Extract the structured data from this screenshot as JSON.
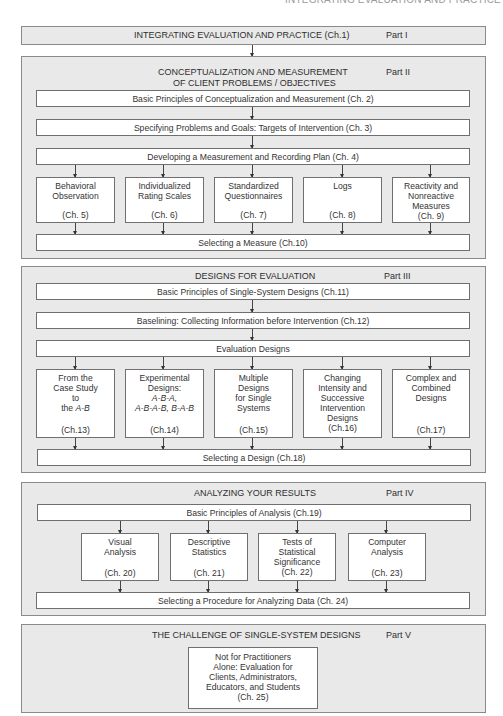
{
  "running_head": "INTEGRATING EVALUATION AND PRACTICE",
  "parts": {
    "p1": {
      "title": "INTEGRATING EVALUATION AND PRACTICE (Ch.1)",
      "label": "Part I"
    },
    "p2": {
      "title_line1": "CONCEPTUALIZATION AND MEASUREMENT",
      "title_line2": "OF CLIENT PROBLEMS / OBJECTIVES",
      "label": "Part II",
      "ch2": "Basic Principles of Conceptualization and Measurement (Ch. 2)",
      "ch3": "Specifying Problems and Goals: Targets of Intervention (Ch. 3)",
      "ch4": "Developing a Measurement and Recording Plan (Ch. 4)",
      "items": [
        {
          "lines": [
            "Behavioral",
            "Observation"
          ],
          "ch": "(Ch. 5)"
        },
        {
          "lines": [
            "Individualized",
            "Rating Scales"
          ],
          "ch": "(Ch. 6)"
        },
        {
          "lines": [
            "Standardized",
            "Questionnaires"
          ],
          "ch": "(Ch. 7)"
        },
        {
          "lines": [
            "Logs"
          ],
          "ch": "(Ch. 8)"
        },
        {
          "lines": [
            "Reactivity and",
            "Nonreactive",
            "Measures"
          ],
          "ch": "(Ch. 9)"
        }
      ],
      "ch10": "Selecting a Measure (Ch.10)"
    },
    "p3": {
      "title": "DESIGNS FOR EVALUATION",
      "label": "Part III",
      "ch11": "Basic Principles of Single-System Designs (Ch.11)",
      "ch12": "Baselining: Collecting Information before Intervention (Ch.12)",
      "eval": "Evaluation Designs",
      "items": [
        {
          "lines": [
            "From the",
            "Case Study",
            "to",
            "the A-B"
          ],
          "ch": "(Ch.13)"
        },
        {
          "lines": [
            "Experimental",
            "Designs:",
            "A-B-A,",
            "A-B-A-B, B-A-B"
          ],
          "ch": "(Ch.14)"
        },
        {
          "lines": [
            "Multiple",
            "Designs",
            "for Single",
            "Systems"
          ],
          "ch": "(Ch.15)"
        },
        {
          "lines": [
            "Changing",
            "Intensity and",
            "Successive",
            "Intervention",
            "Designs"
          ],
          "ch": "(Ch.16)"
        },
        {
          "lines": [
            "Complex and",
            "Combined",
            "Designs"
          ],
          "ch": "(Ch.17)"
        }
      ],
      "ch18": "Selecting a Design (Ch.18)"
    },
    "p4": {
      "title": "ANALYZING YOUR RESULTS",
      "label": "Part IV",
      "ch19": "Basic Principles of Analysis (Ch.19)",
      "items": [
        {
          "lines": [
            "Visual",
            "Analysis"
          ],
          "ch": "(Ch. 20)"
        },
        {
          "lines": [
            "Descriptive",
            "Statistics"
          ],
          "ch": "(Ch. 21)"
        },
        {
          "lines": [
            "Tests of",
            "Statistical",
            "Significance"
          ],
          "ch": "(Ch. 22)"
        },
        {
          "lines": [
            "Computer",
            "Analysis"
          ],
          "ch": "(Ch. 23)"
        }
      ],
      "ch24": "Selecting a Procedure for Analyzing Data (Ch. 24)"
    },
    "p5": {
      "title": "THE CHALLENGE OF SINGLE-SYSTEM DESIGNS",
      "label": "Part V",
      "lines": [
        "Not for Practitioners",
        "Alone: Evaluation for",
        "Clients, Administrators,",
        "Educators, and Students"
      ],
      "ch": "(Ch. 25)"
    }
  }
}
